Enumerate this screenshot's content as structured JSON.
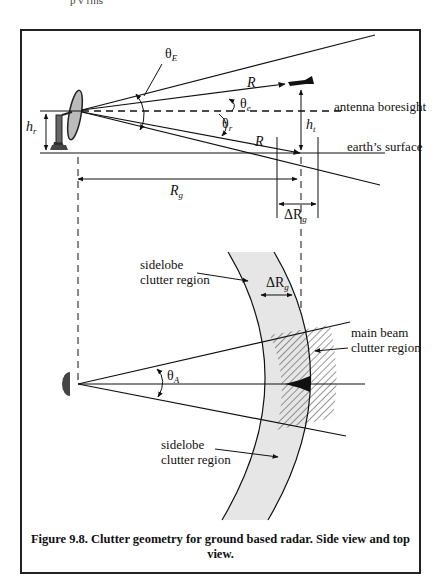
{
  "page_fragment": {
    "top_clip_text": "p  v  rms"
  },
  "side_view": {
    "labels": {
      "theta_E": "θ",
      "theta_E_sub": "E",
      "R_upper": "R",
      "R_lower": "R",
      "theta_e": "θ",
      "theta_e_sub": "e",
      "theta_r": "θ",
      "theta_r_sub": "r",
      "antenna_boresight": "antenna boresight",
      "earths_surface": "earth’s surface",
      "h_r": "h",
      "h_r_sub": "r",
      "h_t": "h",
      "h_t_sub": "t",
      "R_g": "R",
      "R_g_sub": "g",
      "delta_R_g": "ΔR",
      "delta_R_g_sub": "g"
    }
  },
  "top_view": {
    "labels": {
      "sidelobe_upper_line1": "sidelobe",
      "sidelobe_upper_line2": "clutter region",
      "delta_R_g": "ΔR",
      "delta_R_g_sub": "g",
      "main_beam_line1": "main beam",
      "main_beam_line2": "clutter region",
      "theta_A": "θ",
      "theta_A_sub": "A",
      "sidelobe_lower_line1": "sidelobe",
      "sidelobe_lower_line2": "clutter region"
    },
    "colors": {
      "sidelobe_fill": "#e6e6e6",
      "hatch": "#333333"
    }
  },
  "caption": "Figure 9.8. Clutter geometry for ground based radar. Side view and top view."
}
